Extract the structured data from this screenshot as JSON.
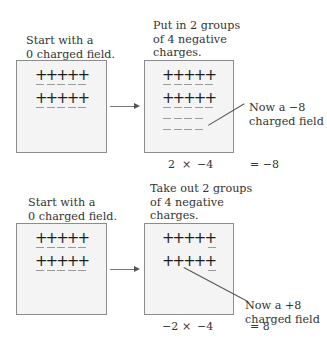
{
  "panels": [
    {
      "left": {
        "caption": "Start with a\n0 charged field."
      },
      "right": {
        "caption": "Put in 2 groups\nof 4 negative\ncharges."
      },
      "annotation": "Now a −8\ncharged field",
      "equation": {
        "lhs_a": "2",
        "op": "×",
        "lhs_b": "−4",
        "result": "= −8"
      }
    },
    {
      "left": {
        "caption": "Start with a\n0 charged field."
      },
      "right": {
        "caption": "Take out 2 groups\nof 4 negative\ncharges."
      },
      "annotation": "Now a +8\ncharged field",
      "equation": {
        "lhs_a": "−2",
        "op": "×",
        "lhs_b": "−4",
        "result": "= 8"
      }
    }
  ],
  "symbols": {
    "plus": "+",
    "minus": "−"
  },
  "colors": {
    "field_bg": "#f4f4f4",
    "border": "#8c8c8c",
    "plus": "#1e1e1e",
    "minus": "#9a9a9a"
  }
}
